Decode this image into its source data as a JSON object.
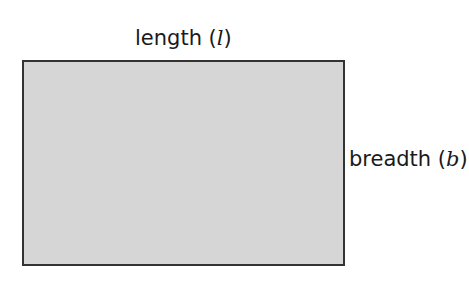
{
  "diagram": {
    "shape": "rectangle",
    "fill_color": "#d6d6d6",
    "border_color": "#333333",
    "labels": {
      "length": {
        "word": "length",
        "open_paren": " (",
        "symbol": "l",
        "close_paren": ")"
      },
      "breadth": {
        "word": "breadth",
        "open_paren": " (",
        "symbol": "b",
        "close_paren": ")"
      }
    }
  }
}
